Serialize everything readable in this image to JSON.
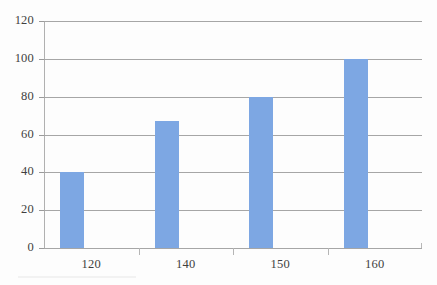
{
  "chart_data": {
    "type": "bar",
    "title": "",
    "subtitle": "",
    "xlabel": "",
    "ylabel": "",
    "categories": [
      "120",
      "140",
      "150",
      "160"
    ],
    "values": [
      40,
      67,
      80,
      100
    ],
    "series": [
      {
        "name": "",
        "values": [
          40,
          67,
          80,
          100
        ]
      }
    ],
    "ylim": [
      0,
      120
    ],
    "ytick_labels": [
      "120",
      "100",
      "80",
      "60",
      "40",
      "20",
      "0"
    ],
    "ytick_values": [
      120,
      100,
      80,
      60,
      40,
      20,
      0
    ],
    "y_tick_interval": 20,
    "grid": "horizontal",
    "legend": "none",
    "annotations": [],
    "colors": {
      "bar": "#7da7e3",
      "gridline": "#a6a6a6",
      "axis": "#b0b0b0",
      "tick_label": "#3f3f3f",
      "background": "#fdfdfd"
    }
  }
}
